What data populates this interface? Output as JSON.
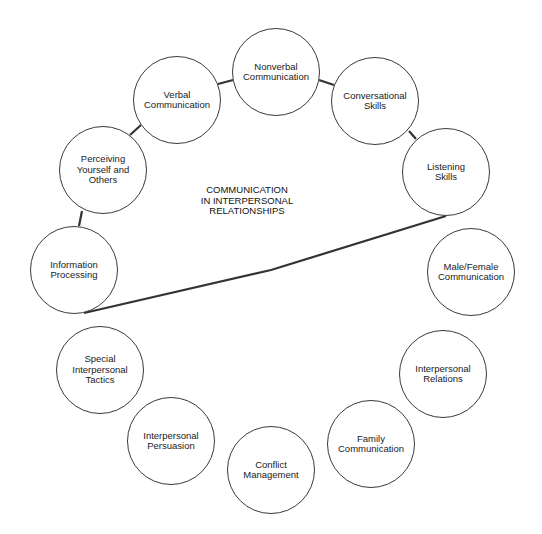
{
  "title": "COMMUNICATION\nIN INTERPERSONAL\nRELATIONSHIPS",
  "nodes": [
    {
      "label": "Nonverbal\nCommunication",
      "cx": 276,
      "cy": 72
    },
    {
      "label": "Conversational\nSkills",
      "cx": 375,
      "cy": 101
    },
    {
      "label": "Listening\nSkills",
      "cx": 446,
      "cy": 172
    },
    {
      "label": "Male/Female\nCommunication",
      "cx": 471,
      "cy": 272
    },
    {
      "label": "Interpersonal\nRelations",
      "cx": 443,
      "cy": 374
    },
    {
      "label": "Family\nCommunication",
      "cx": 371,
      "cy": 444
    },
    {
      "label": "Conflict\nManagement",
      "cx": 271,
      "cy": 470
    },
    {
      "label": "Interpersonal\nPersuasion",
      "cx": 171,
      "cy": 441
    },
    {
      "label": "Special\nInterpersonal\nTactics",
      "cx": 100,
      "cy": 370
    },
    {
      "label": "Information\nProcessing",
      "cx": 74,
      "cy": 270
    },
    {
      "label": "Perceiving\nYourself and\nOthers",
      "cx": 103,
      "cy": 170
    },
    {
      "label": "Verbal\nCommunication",
      "cx": 177,
      "cy": 100
    }
  ],
  "connectors": [
    {
      "from": "Verbal Communication",
      "to": "Nonverbal Communication",
      "points": [
        [
          218,
          84
        ],
        [
          233,
          80
        ]
      ]
    },
    {
      "from": "Nonverbal Communication",
      "to": "Conversational Skills",
      "points": [
        [
          319,
          80
        ],
        [
          334,
          85
        ]
      ]
    },
    {
      "from": "Conversational Skills",
      "to": "Listening Skills",
      "points": [
        [
          409,
          131
        ],
        [
          416,
          139
        ]
      ]
    },
    {
      "from": "Perceiving Yourself and Others",
      "to": "Verbal Communication",
      "points": [
        [
          130,
          135
        ],
        [
          141,
          125
        ]
      ]
    },
    {
      "from": "Information Processing",
      "to": "Perceiving Yourself and Others",
      "points": [
        [
          82,
          211
        ],
        [
          79,
          226
        ]
      ]
    },
    {
      "from": "Listening Skills",
      "to": "Information Processing",
      "points": [
        [
          446,
          216
        ],
        [
          271,
          270
        ],
        [
          84,
          313
        ]
      ]
    }
  ]
}
